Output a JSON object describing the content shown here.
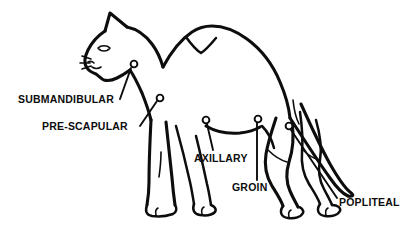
{
  "diagram": {
    "kind": "veterinary-anatomy-line-drawing",
    "view": "left lateral profile, standing",
    "colors": {
      "background": "#ffffff",
      "ink": "#0d0d0d",
      "marker_fill": "#ffffff"
    },
    "labels": [
      {
        "id": "submandibular",
        "text": "SUBMANDIBULAR",
        "node_name": "submandibular-node-marker",
        "marker": {
          "cx": 134,
          "cy": 64,
          "r": 3.4
        },
        "leader": "M 120 99 L 131 68"
      },
      {
        "id": "prescapular",
        "text": "PRE-SCAPULAR",
        "node_name": "prescapular-node-marker",
        "marker": {
          "cx": 160,
          "cy": 98,
          "r": 3.4
        },
        "leader": "M 140 126 L 157 101"
      },
      {
        "id": "axillary",
        "text": "AXILLARY",
        "node_name": "axillary-node-marker",
        "marker": {
          "cx": 206,
          "cy": 120,
          "r": 3.4
        },
        "leader": "M 213 150 L 207 124"
      },
      {
        "id": "groin",
        "text": "GROIN",
        "node_name": "groin-node-marker",
        "marker": {
          "cx": 258,
          "cy": 119,
          "r": 3.4
        },
        "leader": "M 257 180 L 257 123"
      },
      {
        "id": "popliteal",
        "text": "POPLITEAL",
        "node_name": "popliteal-node-marker",
        "marker": {
          "cx": 289,
          "cy": 126,
          "r": 3.4
        },
        "leader": "M 337 198 L 291 130"
      }
    ]
  }
}
